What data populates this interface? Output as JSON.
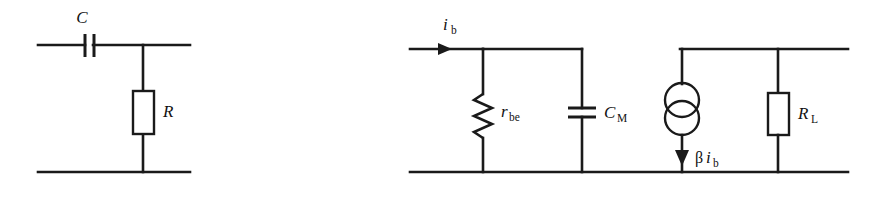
{
  "figure": {
    "background_color": "#ffffff",
    "line_color": "#1a1a1a",
    "width": 884,
    "height": 198
  },
  "circuit_left": {
    "name": "RC high-pass network",
    "components": [
      {
        "id": "C",
        "type": "capacitor",
        "label": "C",
        "subscript": "",
        "orientation": "horizontal",
        "style": "parallel-plate"
      },
      {
        "id": "R",
        "type": "resistor",
        "label": "R",
        "subscript": "",
        "orientation": "vertical",
        "style": "rectangular-box"
      }
    ]
  },
  "circuit_right": {
    "name": "BJT hybrid-pi equivalent circuit",
    "input_current": {
      "label": "i",
      "subscript": "b",
      "direction": "right"
    },
    "components": [
      {
        "id": "rbe",
        "type": "resistor",
        "label": "r",
        "subscript": "be",
        "orientation": "vertical",
        "style": "zigzag"
      },
      {
        "id": "CM",
        "type": "capacitor",
        "label": "C",
        "subscript": "M",
        "orientation": "vertical",
        "style": "parallel-plate"
      },
      {
        "id": "beta_ib",
        "type": "dependent-current-source",
        "label_greek": "β",
        "label": "i",
        "subscript": "b",
        "orientation": "vertical",
        "direction": "down",
        "style": "double-circle"
      },
      {
        "id": "RL",
        "type": "resistor",
        "label": "R",
        "subscript": "L",
        "orientation": "vertical",
        "style": "rectangular-box"
      }
    ]
  }
}
